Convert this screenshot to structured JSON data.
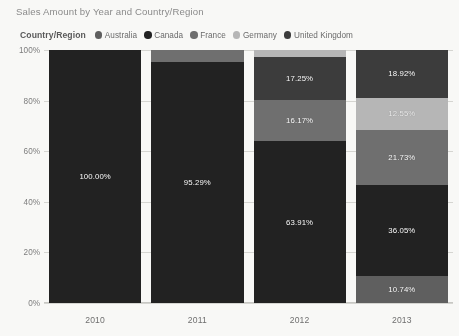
{
  "chart_title": "Sales Amount by Year and Country/Region",
  "legend": {
    "title": "Country/Region",
    "items": [
      {
        "label": "Australia",
        "color": "#5e5e5e",
        "icon": "legend-dot-icon"
      },
      {
        "label": "Canada",
        "color": "#1f1f1f",
        "icon": "legend-dot-icon"
      },
      {
        "label": "France",
        "color": "#6e6e6e",
        "icon": "legend-dot-icon"
      },
      {
        "label": "Germany",
        "color": "#b8b8b8",
        "icon": "legend-dot-icon"
      },
      {
        "label": "United Kingdom",
        "color": "#3a3a3a",
        "icon": "legend-dot-icon"
      }
    ]
  },
  "y_ticks": [
    "100%",
    "80%",
    "60%",
    "40%",
    "20%",
    "0%"
  ],
  "x_ticks": [
    "2010",
    "2011",
    "2012",
    "2013"
  ],
  "columns": [
    {
      "year": "2010",
      "segments": [
        {
          "series": "Canada",
          "value": 100.0,
          "label": "100.00%",
          "color": "#1f1f1f",
          "show_label": true
        }
      ]
    },
    {
      "year": "2011",
      "segments": [
        {
          "series": "France",
          "value": 4.71,
          "label": "4.71%",
          "color": "#6e6e6e",
          "show_label": false
        },
        {
          "series": "Canada",
          "value": 95.29,
          "label": "95.29%",
          "color": "#1f1f1f",
          "show_label": true
        }
      ]
    },
    {
      "year": "2012",
      "segments": [
        {
          "series": "Germany",
          "value": 2.67,
          "label": "2.67%",
          "color": "#b8b8b8",
          "show_label": false
        },
        {
          "series": "United Kingdom",
          "value": 17.25,
          "label": "17.25%",
          "color": "#3a3a3a",
          "show_label": true
        },
        {
          "series": "France",
          "value": 16.17,
          "label": "16.17%",
          "color": "#6e6e6e",
          "show_label": true
        },
        {
          "series": "Canada",
          "value": 63.91,
          "label": "63.91%",
          "color": "#1f1f1f",
          "show_label": true
        }
      ]
    },
    {
      "year": "2013",
      "segments": [
        {
          "series": "United Kingdom",
          "value": 18.92,
          "label": "18.92%",
          "color": "#3a3a3a",
          "show_label": true
        },
        {
          "series": "Germany",
          "value": 12.55,
          "label": "12.55%",
          "color": "#b8b8b8",
          "show_label": true
        },
        {
          "series": "France",
          "value": 21.73,
          "label": "21.73%",
          "color": "#6e6e6e",
          "show_label": true
        },
        {
          "series": "Canada",
          "value": 36.05,
          "label": "36.05%",
          "color": "#1f1f1f",
          "show_label": true
        },
        {
          "series": "Australia",
          "value": 10.74,
          "label": "10.74%",
          "color": "#5e5e5e",
          "show_label": true
        }
      ]
    }
  ],
  "chart_data": {
    "type": "bar",
    "title": "Sales Amount by Year and Country/Region",
    "subtitle": "",
    "stacked": true,
    "normalized_100pct": true,
    "orientation": "vertical",
    "xlabel": "",
    "ylabel": "",
    "ylim": [
      0,
      100
    ],
    "ytick_format": "percent",
    "yticks": [
      0,
      20,
      40,
      60,
      80,
      100
    ],
    "grid": true,
    "legend_position": "top",
    "legend_title": "Country/Region",
    "categories": [
      "2010",
      "2011",
      "2012",
      "2013"
    ],
    "series": [
      {
        "name": "Australia",
        "color": "#5e5e5e",
        "values": [
          0,
          0,
          0,
          10.74
        ]
      },
      {
        "name": "Canada",
        "color": "#1f1f1f",
        "values": [
          100.0,
          95.29,
          63.91,
          36.05
        ]
      },
      {
        "name": "France",
        "color": "#6e6e6e",
        "values": [
          0,
          4.71,
          16.17,
          21.73
        ]
      },
      {
        "name": "Germany",
        "color": "#b8b8b8",
        "values": [
          0,
          0,
          2.67,
          12.55
        ]
      },
      {
        "name": "United Kingdom",
        "color": "#3a3a3a",
        "values": [
          0,
          0,
          17.25,
          18.92
        ]
      }
    ],
    "data_labels": [
      {
        "category": "2010",
        "series": "Canada",
        "label": "100.00%"
      },
      {
        "category": "2011",
        "series": "Canada",
        "label": "95.29%"
      },
      {
        "category": "2012",
        "series": "Canada",
        "label": "63.91%"
      },
      {
        "category": "2012",
        "series": "France",
        "label": "16.17%"
      },
      {
        "category": "2012",
        "series": "United Kingdom",
        "label": "17.25%"
      },
      {
        "category": "2013",
        "series": "Australia",
        "label": "10.74%"
      },
      {
        "category": "2013",
        "series": "Canada",
        "label": "36.05%"
      },
      {
        "category": "2013",
        "series": "France",
        "label": "21.73%"
      },
      {
        "category": "2013",
        "series": "Germany",
        "label": "12.55%"
      },
      {
        "category": "2013",
        "series": "United Kingdom",
        "label": "18.92%"
      }
    ]
  }
}
